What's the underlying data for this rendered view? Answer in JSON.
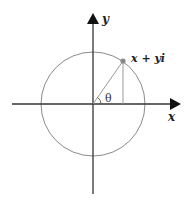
{
  "diagram": {
    "type": "complex-plane-unit-circle",
    "labels": {
      "y_axis": "y",
      "x_axis": "x",
      "point": "x + yi",
      "angle": "θ"
    },
    "colors": {
      "axes": "#333333",
      "circle": "#8a8a8a",
      "radius_line": "#9a9a9a",
      "projection_line": "#9a9a9a",
      "point": "#888888",
      "text": "#222222"
    },
    "geometry": {
      "origin": [
        93,
        104
      ],
      "radius": 52,
      "point": [
        123,
        60
      ],
      "angle_deg": 56
    }
  }
}
